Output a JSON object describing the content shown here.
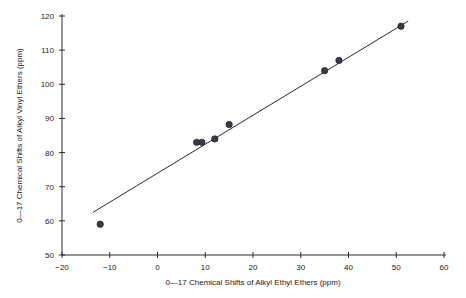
{
  "figure": {
    "background_color": "#ffffff",
    "marker_color": "#3a3a42",
    "line_color": "#2b2b2b"
  },
  "chart_data": {
    "type": "scatter",
    "title": "",
    "xlabel": "0—17 Chemical Shifts of Alkyl Ethyl Ethers (ppm)",
    "ylabel": "0—17 Chemical Shifts of Alkyl Vinyl Ethers (ppm)",
    "xlim": [
      -20,
      60
    ],
    "ylim": [
      50,
      120
    ],
    "xticks": [
      -20,
      -10,
      0,
      10,
      20,
      30,
      40,
      50,
      60
    ],
    "xtick_labels": [
      "−20",
      "−10",
      "0",
      "10",
      "20",
      "30",
      "40",
      "50",
      "60"
    ],
    "yticks": [
      50,
      60,
      70,
      80,
      90,
      100,
      110,
      120
    ],
    "ytick_labels": [
      "50",
      "60",
      "70",
      "80",
      "90",
      "100",
      "110",
      "120"
    ],
    "grid": false,
    "legend": null,
    "points": [
      {
        "x": -12.0,
        "y": 59.0
      },
      {
        "x": 8.2,
        "y": 83.0
      },
      {
        "x": 9.3,
        "y": 83.0
      },
      {
        "x": 12.0,
        "y": 84.0
      },
      {
        "x": 15.0,
        "y": 88.2
      },
      {
        "x": 35.0,
        "y": 104.0
      },
      {
        "x": 38.0,
        "y": 107.0
      },
      {
        "x": 51.0,
        "y": 117.0
      }
    ],
    "trend_line": {
      "x_start": -13.5,
      "y_start": 62.5,
      "x_end": 52.5,
      "y_end": 118.5
    }
  }
}
